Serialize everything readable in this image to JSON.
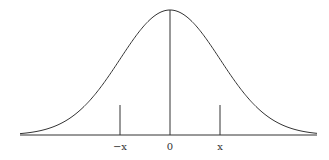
{
  "chart_data": {
    "type": "line",
    "title": "",
    "xlabel": "",
    "ylabel": "",
    "tick_labels": [
      "−x",
      "0",
      "x"
    ],
    "markers": [
      {
        "label": "−x",
        "position": -1
      },
      {
        "label": "0",
        "position": 0
      },
      {
        "label": "x",
        "position": 1
      }
    ],
    "xlim": [
      -3,
      3
    ],
    "grid": false,
    "legend": null
  },
  "labels": {
    "neg_x": "−x",
    "zero": "0",
    "pos_x": "x"
  },
  "colors": {
    "line": "#333333",
    "background": "#ffffff"
  }
}
